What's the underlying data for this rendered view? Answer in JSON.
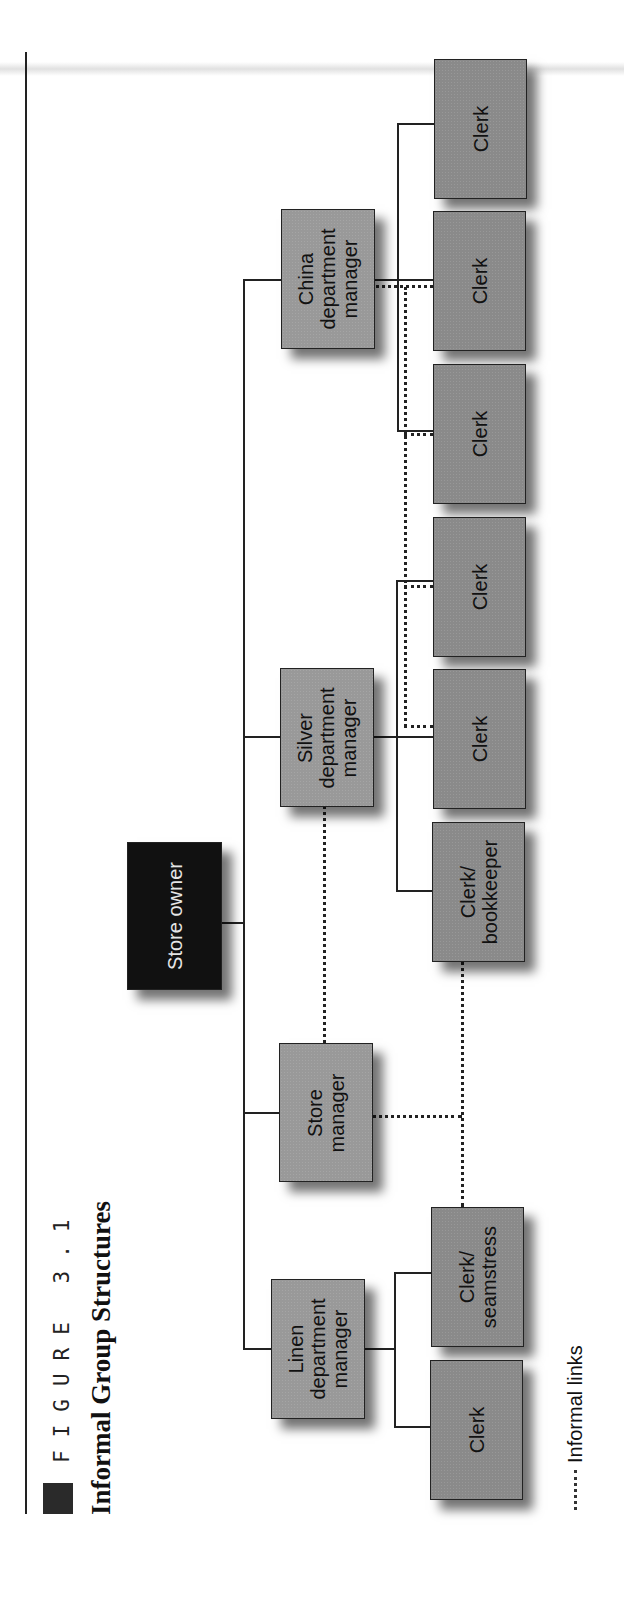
{
  "figure": {
    "label": "FIGURE 3.1",
    "title": "Informal Group Structures"
  },
  "legend": {
    "symbol": "dotted-line",
    "text": "Informal links"
  },
  "colors": {
    "owner_fill": "#111111",
    "box_fill": "#8a8a8a",
    "line": "#222222",
    "background": "#ffffff"
  },
  "org": {
    "owner": "Store owner",
    "managers": [
      {
        "id": "linen",
        "label": "Linen\ndepartment\nmanager"
      },
      {
        "id": "store",
        "label": "Store\nmanager"
      },
      {
        "id": "silver",
        "label": "Silver\ndepartment\nmanager"
      },
      {
        "id": "china",
        "label": "China\ndepartment\nmanager"
      }
    ],
    "staff": [
      {
        "manager": "linen",
        "label": "Clerk"
      },
      {
        "manager": "linen",
        "label": "Clerk/\nseamstress"
      },
      {
        "manager": "silver",
        "label": "Clerk/\nbookkeeper"
      },
      {
        "manager": "silver",
        "label": "Clerk"
      },
      {
        "manager": "silver",
        "label": "Clerk"
      },
      {
        "manager": "china",
        "label": "Clerk"
      },
      {
        "manager": "china",
        "label": "Clerk"
      },
      {
        "manager": "china",
        "label": "Clerk"
      }
    ],
    "informal_links": [
      [
        "Store manager",
        "Silver department manager"
      ],
      [
        "Store manager",
        "Clerk/bookkeeper"
      ],
      [
        "Store manager",
        "Clerk/seamstress"
      ],
      [
        "China department manager",
        "Clerk (silver)"
      ],
      [
        "China department manager",
        "Clerk (china)"
      ]
    ]
  }
}
